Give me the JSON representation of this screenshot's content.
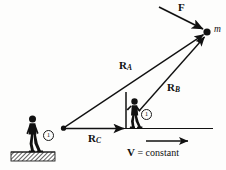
{
  "figure": {
    "background_color": "#fdfdfc",
    "ink_color": "#111111",
    "mass": {
      "label": "m",
      "point": [
        207,
        32
      ]
    },
    "force": {
      "label": "F",
      "label_pos": [
        180,
        3
      ],
      "from": [
        159,
        7
      ],
      "to": [
        205,
        30
      ]
    },
    "vectors": [
      {
        "name": "R_A",
        "base": "R",
        "subscript": "A",
        "label_pos": [
          120,
          60
        ],
        "from": [
          63,
          128
        ],
        "to": [
          205,
          34
        ]
      },
      {
        "name": "R_B",
        "base": "R",
        "subscript": "B",
        "label_pos": [
          168,
          82
        ],
        "from": [
          139,
          111
        ],
        "to": [
          206,
          36
        ]
      },
      {
        "name": "R_C",
        "base": "R",
        "subscript": "C",
        "label_pos": [
          89,
          134
        ],
        "from": [
          63,
          128
        ],
        "to": [
          126,
          128
        ]
      }
    ],
    "velocity": {
      "label_bold": "V",
      "label_rest": " = constant",
      "label_pos": [
        127,
        150
      ],
      "arrow_from": [
        145,
        141
      ],
      "arrow_to": [
        190,
        141
      ]
    },
    "ground_line": {
      "from": [
        63,
        128
      ],
      "to": [
        213,
        128
      ]
    },
    "observers": [
      {
        "name": "stationary-observer",
        "badge": "1",
        "badge_pos": [
          43,
          131
        ],
        "figure_pos": [
          18,
          113
        ],
        "on_hatched_ground": true
      },
      {
        "name": "moving-observer",
        "badge": "1",
        "badge_pos": [
          141,
          110
        ],
        "figure_pos": [
          120,
          97
        ],
        "has_vertical_pole": true
      }
    ]
  }
}
